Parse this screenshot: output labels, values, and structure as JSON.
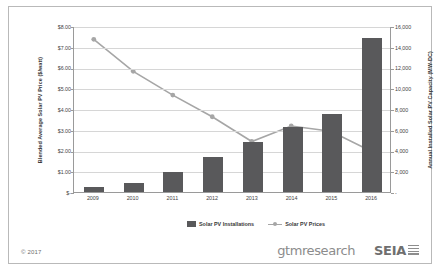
{
  "footer": {
    "copyright": "© 2017",
    "brand_primary": "gtmresearch",
    "brand_secondary": "SEIA",
    "seia_mark_icon": "striped-square-icon"
  },
  "legend": {
    "items": [
      {
        "label": "Solar PV Installations",
        "type": "bar",
        "color": "#59595b"
      },
      {
        "label": "Solar PV Prices",
        "type": "line-marker",
        "color": "#a6a6a6"
      }
    ]
  },
  "chart_data": {
    "type": "bar",
    "title": "",
    "categories": [
      "2009",
      "2010",
      "2011",
      "2012",
      "2013",
      "2014",
      "2015",
      "2016"
    ],
    "xlabel": "",
    "ylabel": "Annual Installed Solar PV Capacity (MW-DC)",
    "y2label": "Blended Average Solar PV Price ($/watt)",
    "grid": true,
    "legend_position": "bottom",
    "series": [
      {
        "name": "Solar PV Installations",
        "type": "bar",
        "axis": "right",
        "unit": "MW-DC",
        "color": "#59595b",
        "values": [
          440,
          870,
          1900,
          3400,
          4800,
          6250,
          7500,
          14800
        ]
      },
      {
        "name": "Solar PV Prices",
        "type": "line",
        "axis": "left",
        "unit": "$/watt",
        "color": "#a6a6a6",
        "values": [
          7.4,
          5.85,
          4.7,
          3.65,
          2.45,
          3.2,
          2.95,
          2.0
        ]
      }
    ],
    "left_axis": {
      "label": "Blended Average Solar PV Price ($/watt)",
      "ticks": [
        "$-",
        "$1.00",
        "$2.00",
        "$3.00",
        "$4.00",
        "$5.00",
        "$6.00",
        "$7.00",
        "$8.00"
      ],
      "min": 0,
      "max": 8
    },
    "right_axis": {
      "label": "Annual Installed Solar PV Capacity (MW-DC)",
      "ticks": [
        "-",
        "2,000",
        "4,000",
        "6,000",
        "8,000",
        "10,000",
        "12,000",
        "14,000",
        "16,000"
      ],
      "min": 0,
      "max": 16000
    }
  }
}
